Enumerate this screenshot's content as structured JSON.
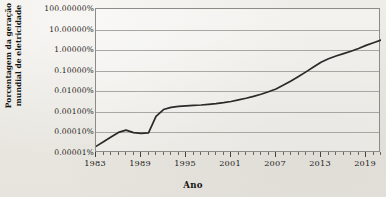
{
  "chart_data": {
    "type": "line",
    "title": "",
    "xlabel": "Ano",
    "ylabel_line1": "Porcentagem da geração",
    "ylabel_line2": "mundial de eletricidade",
    "ylabel": "Porcentagem da geração mundial de eletricidade",
    "yscale": "log",
    "ylim": [
      1e-05,
      100
    ],
    "xlim": [
      1983,
      2021
    ],
    "grid": true,
    "legend": false,
    "line_color": "#2b2a28",
    "background_color": "#eceae4",
    "gridline_color": "#a9a7a1",
    "ytick_labels": [
      "100.00000%",
      "10.00000%",
      "1.00000%",
      "0.10000%",
      "0.01000%",
      "0.00100%",
      "0.00010%",
      "0.00001%"
    ],
    "ytick_values": [
      100,
      10,
      1,
      0.1,
      0.01,
      0.001,
      0.0001,
      1e-05
    ],
    "xtick_labels": [
      "1983",
      "1989",
      "1995",
      "2001",
      "2007",
      "2013",
      "2019"
    ],
    "xtick_values": [
      1983,
      1989,
      1995,
      2001,
      2007,
      2013,
      2019
    ],
    "series": [
      {
        "name": "Porcentagem da geração mundial de eletricidade",
        "x": [
          1983,
          1984,
          1985,
          1986,
          1987,
          1988,
          1989,
          1990,
          1991,
          1992,
          1993,
          1994,
          1995,
          1996,
          1997,
          1998,
          1999,
          2000,
          2001,
          2002,
          2003,
          2004,
          2005,
          2006,
          2007,
          2008,
          2009,
          2010,
          2011,
          2012,
          2013,
          2014,
          2015,
          2016,
          2017,
          2018,
          2019,
          2020,
          2021
        ],
        "y": [
          2.1e-05,
          3.5e-05,
          6e-05,
          0.0001,
          0.00013,
          9.8e-05,
          9e-05,
          9.5e-05,
          0.0006,
          0.0013,
          0.00165,
          0.00185,
          0.00195,
          0.00205,
          0.00215,
          0.0023,
          0.0025,
          0.0028,
          0.0032,
          0.0038,
          0.0046,
          0.0057,
          0.0072,
          0.0095,
          0.013,
          0.02,
          0.032,
          0.052,
          0.088,
          0.15,
          0.26,
          0.38,
          0.52,
          0.68,
          0.88,
          1.2,
          1.7,
          2.3,
          3.1
        ]
      }
    ]
  }
}
